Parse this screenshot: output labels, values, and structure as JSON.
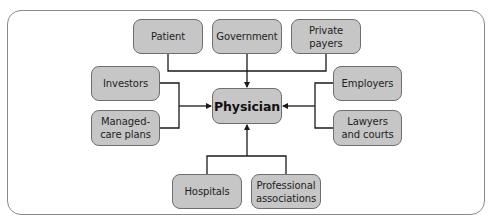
{
  "diagram": {
    "center": {
      "id": "physician",
      "label": "Physician"
    },
    "nodes": {
      "patient": {
        "label": "Patient",
        "position": "top"
      },
      "government": {
        "label": "Government",
        "position": "top"
      },
      "private_payers": {
        "label": "Private\npayers",
        "position": "top"
      },
      "investors": {
        "label": "Investors",
        "position": "left"
      },
      "managed_care": {
        "label": "Managed-\ncare plans",
        "position": "left"
      },
      "employers": {
        "label": "Employers",
        "position": "right"
      },
      "lawyers": {
        "label": "Lawyers\nand courts",
        "position": "right"
      },
      "hospitals": {
        "label": "Hospitals",
        "position": "bottom"
      },
      "professional": {
        "label": "Professional\nassociations",
        "position": "bottom"
      }
    },
    "edges": [
      {
        "from": "patient",
        "to": "physician"
      },
      {
        "from": "government",
        "to": "physician"
      },
      {
        "from": "private_payers",
        "to": "physician"
      },
      {
        "from": "investors",
        "to": "physician"
      },
      {
        "from": "managed_care",
        "to": "physician"
      },
      {
        "from": "employers",
        "to": "physician"
      },
      {
        "from": "lawyers",
        "to": "physician"
      },
      {
        "from": "hospitals",
        "to": "physician"
      },
      {
        "from": "professional",
        "to": "physician"
      }
    ],
    "colors": {
      "node_fill": "#c6c6c6",
      "node_border": "#6e6e6e",
      "line": "#1a1a1a",
      "frame": "#8a8a8a"
    }
  }
}
